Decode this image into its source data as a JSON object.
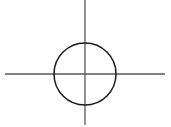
{
  "figure": {
    "name": "circle-with-crosshair-axes",
    "width": 171,
    "height": 127,
    "background_color": "#ffffff"
  },
  "chart_data": {
    "type": "scatter",
    "title": "",
    "subtitle": "",
    "xlabel": "",
    "ylabel": "",
    "grid": false,
    "legend": null,
    "annotations": [],
    "categories": [],
    "values": [],
    "shapes": [
      {
        "kind": "line",
        "name": "vertical-axis",
        "orientation": "vertical",
        "x1": 85,
        "y1": 0,
        "x2": 85,
        "y2": 125,
        "stroke": "#59595b",
        "stroke_width": 1.3
      },
      {
        "kind": "line",
        "name": "horizontal-axis",
        "orientation": "horizontal",
        "x1": 5,
        "y1": 74,
        "x2": 165,
        "y2": 74,
        "stroke": "#59595b",
        "stroke_width": 1.3
      },
      {
        "kind": "circle",
        "name": "main-circle",
        "cx": 85,
        "cy": 74,
        "r": 31,
        "stroke": "#1a1a1a",
        "stroke_width": 1.5,
        "fill": "none"
      }
    ],
    "center_point": {
      "x": 85,
      "y": 74,
      "label": ""
    }
  }
}
